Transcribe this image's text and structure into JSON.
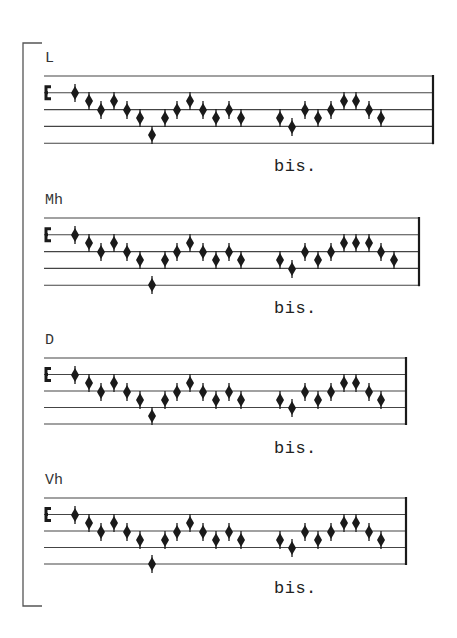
{
  "page": {
    "background": "#ffffff",
    "ink": "#1a1a1a",
    "bracket": {
      "x": 23,
      "top": 43,
      "bottom": 606,
      "tick_to": 42
    }
  },
  "staves": [
    {
      "label": "L",
      "repeat_text": "bis.",
      "label_pos": [
        45,
        50
      ],
      "bis_pos": [
        274,
        157
      ],
      "top": 76,
      "spacing": 16.8,
      "x_start": 44,
      "x_end": 433,
      "notes": [
        [
          75,
          93
        ],
        [
          89,
          101
        ],
        [
          101,
          110
        ],
        [
          114,
          101
        ],
        [
          127,
          110
        ],
        [
          140,
          118
        ],
        [
          152,
          135
        ],
        [
          165,
          118
        ],
        [
          177,
          110
        ],
        [
          190,
          101
        ],
        [
          203,
          110
        ],
        [
          216,
          118
        ],
        [
          229,
          110
        ],
        [
          241,
          118
        ],
        [
          280,
          118
        ],
        [
          292,
          127
        ],
        [
          305,
          110
        ],
        [
          318,
          118
        ],
        [
          331,
          110
        ],
        [
          344,
          101
        ],
        [
          356,
          101
        ],
        [
          369,
          110
        ],
        [
          381,
          118
        ]
      ]
    },
    {
      "label": "Mh",
      "repeat_text": "bis.",
      "label_pos": [
        45,
        192
      ],
      "bis_pos": [
        274,
        299
      ],
      "top": 218,
      "spacing": 16.8,
      "x_start": 44,
      "x_end": 419,
      "notes": [
        [
          75,
          235
        ],
        [
          89,
          243
        ],
        [
          101,
          252
        ],
        [
          114,
          243
        ],
        [
          127,
          252
        ],
        [
          140,
          260
        ],
        [
          152,
          285
        ],
        [
          165,
          260
        ],
        [
          177,
          252
        ],
        [
          190,
          243
        ],
        [
          203,
          252
        ],
        [
          216,
          260
        ],
        [
          229,
          252
        ],
        [
          241,
          260
        ],
        [
          280,
          260
        ],
        [
          292,
          269
        ],
        [
          305,
          252
        ],
        [
          318,
          260
        ],
        [
          331,
          252
        ],
        [
          344,
          243
        ],
        [
          356,
          243
        ],
        [
          369,
          243
        ],
        [
          381,
          252
        ],
        [
          394,
          260
        ]
      ]
    },
    {
      "label": "D",
      "repeat_text": "bis.",
      "label_pos": [
        45,
        332
      ],
      "bis_pos": [
        274,
        439
      ],
      "top": 358,
      "spacing": 16.5,
      "x_start": 44,
      "x_end": 406,
      "notes": [
        [
          75,
          375
        ],
        [
          89,
          383
        ],
        [
          101,
          392
        ],
        [
          114,
          383
        ],
        [
          127,
          392
        ],
        [
          140,
          400
        ],
        [
          152,
          416
        ],
        [
          165,
          400
        ],
        [
          177,
          392
        ],
        [
          190,
          383
        ],
        [
          203,
          392
        ],
        [
          216,
          400
        ],
        [
          229,
          392
        ],
        [
          241,
          400
        ],
        [
          280,
          400
        ],
        [
          292,
          408
        ],
        [
          305,
          392
        ],
        [
          318,
          400
        ],
        [
          331,
          392
        ],
        [
          344,
          383
        ],
        [
          356,
          383
        ],
        [
          369,
          392
        ],
        [
          381,
          400
        ]
      ]
    },
    {
      "label": "Vh",
      "repeat_text": "bis.",
      "label_pos": [
        45,
        472
      ],
      "bis_pos": [
        274,
        579
      ],
      "top": 498,
      "spacing": 16.5,
      "x_start": 44,
      "x_end": 406,
      "notes": [
        [
          75,
          515
        ],
        [
          89,
          523
        ],
        [
          101,
          532
        ],
        [
          114,
          523
        ],
        [
          127,
          532
        ],
        [
          140,
          540
        ],
        [
          152,
          564
        ],
        [
          165,
          540
        ],
        [
          177,
          532
        ],
        [
          190,
          523
        ],
        [
          203,
          532
        ],
        [
          216,
          540
        ],
        [
          229,
          532
        ],
        [
          241,
          540
        ],
        [
          280,
          540
        ],
        [
          292,
          548
        ],
        [
          305,
          532
        ],
        [
          318,
          540
        ],
        [
          331,
          532
        ],
        [
          344,
          523
        ],
        [
          356,
          523
        ],
        [
          369,
          532
        ],
        [
          381,
          540
        ]
      ]
    }
  ],
  "clef": {
    "name": "c-clef-icon",
    "x": 46
  }
}
